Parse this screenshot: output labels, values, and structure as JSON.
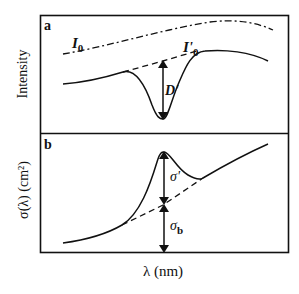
{
  "figure": {
    "xlabel": "λ (nm)",
    "panels": [
      {
        "id": "a",
        "panel_label": "a",
        "ylabel": "Intensity",
        "curve_labels": {
          "I0": "I",
          "I0_sub": "0",
          "I0prime": "I'",
          "I0prime_sub": "0",
          "D": "D'"
        },
        "series": [
          {
            "name": "I0 (incident intensity)",
            "style": "dash-dot"
          },
          {
            "name": "I (transmitted intensity)",
            "style": "solid"
          },
          {
            "name": "I'0 (baseline)",
            "style": "dashed"
          }
        ],
        "annotation": "Double-headed arrow D' from baseline to absorption minimum"
      },
      {
        "id": "b",
        "panel_label": "b",
        "ylabel": "σ(λ) (cm²)",
        "curve_labels": {
          "sigma_prime": "σ'",
          "sigma_b": "σ",
          "sigma_b_sub": "b"
        },
        "series": [
          {
            "name": "σ(λ) total cross-section",
            "style": "solid"
          },
          {
            "name": "σb background",
            "style": "dashed"
          }
        ],
        "annotation": "Arrows σ' (peak above background) and σb (background above axis)"
      }
    ]
  },
  "colors": {
    "line": "#111111",
    "background": "#ffffff"
  }
}
